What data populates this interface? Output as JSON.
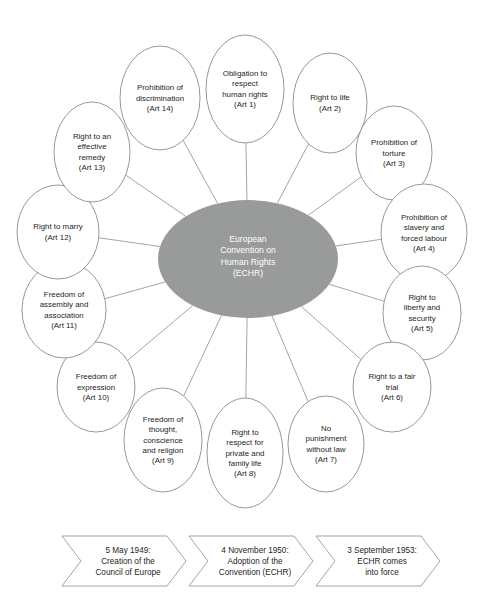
{
  "hub": {
    "lines": [
      "European",
      "Convention on",
      "Human Rights",
      "(ECHR)"
    ],
    "fill_color": "#999a9a",
    "text_color": "#ffffff"
  },
  "nodes": [
    {
      "id": "art-1",
      "lines": [
        "Obligation to",
        "respect",
        "human rights",
        "(Art 1)"
      ],
      "cx": 245,
      "cy": 89,
      "rx": 39,
      "ry": 54
    },
    {
      "id": "art-2",
      "lines": [
        "Right to life",
        "(Art 2)"
      ],
      "cx": 330,
      "cy": 103,
      "rx": 37,
      "ry": 50
    },
    {
      "id": "art-3",
      "lines": [
        "Prohibition of",
        "torture",
        "(Art 3)"
      ],
      "cx": 394,
      "cy": 153,
      "rx": 38,
      "ry": 47
    },
    {
      "id": "art-4",
      "lines": [
        "Prohibition of",
        "slavery and",
        "forced labour",
        "(Art 4)"
      ],
      "cx": 424,
      "cy": 233,
      "rx": 43,
      "ry": 49
    },
    {
      "id": "art-5",
      "lines": [
        "Right to",
        "liberty and",
        "security",
        "(Art 5)"
      ],
      "cx": 422,
      "cy": 313,
      "rx": 39,
      "ry": 47
    },
    {
      "id": "art-6",
      "lines": [
        "Right to a fair",
        "trial",
        "(Art 6)"
      ],
      "cx": 392,
      "cy": 387,
      "rx": 39,
      "ry": 45
    },
    {
      "id": "art-7",
      "lines": [
        "No",
        "punishment",
        "without law",
        "(Art 7)"
      ],
      "cx": 326,
      "cy": 444,
      "rx": 38,
      "ry": 48
    },
    {
      "id": "art-8",
      "lines": [
        "Right to",
        "respect for",
        "private and",
        "family life",
        "(Art 8)"
      ],
      "cx": 245,
      "cy": 453,
      "rx": 38,
      "ry": 55
    },
    {
      "id": "art-9",
      "lines": [
        "Freedom of",
        "thought,",
        "conscience",
        "and religion",
        "(Art 9)"
      ],
      "cx": 163,
      "cy": 440,
      "rx": 39,
      "ry": 52
    },
    {
      "id": "art-10",
      "lines": [
        "Freedom of",
        "expression",
        "(Art 10)"
      ],
      "cx": 96,
      "cy": 387,
      "rx": 39,
      "ry": 45
    },
    {
      "id": "art-11",
      "lines": [
        "Freedom of",
        "assembly and",
        "association",
        "(Art 11)"
      ],
      "cx": 64,
      "cy": 310,
      "rx": 42,
      "ry": 48
    },
    {
      "id": "art-12",
      "lines": [
        "Right to marry",
        "(Art 12)"
      ],
      "cx": 58,
      "cy": 232,
      "rx": 41,
      "ry": 47
    },
    {
      "id": "art-13",
      "lines": [
        "Right to an",
        "effective",
        "remedy",
        "(Art 13)"
      ],
      "cx": 92,
      "cy": 152,
      "rx": 38,
      "ry": 50
    },
    {
      "id": "art-14",
      "lines": [
        "Prohibition of",
        "discrimination",
        "(Art 14)"
      ],
      "cx": 160,
      "cy": 98,
      "rx": 40,
      "ry": 52
    }
  ],
  "timeline": [
    {
      "id": "timeline-1",
      "lines": [
        "5 May 1949:",
        "Creation of the",
        "Council of Europe"
      ]
    },
    {
      "id": "timeline-2",
      "lines": [
        "4 November 1950:",
        "Adoption of the",
        "Convention (ECHR)"
      ]
    },
    {
      "id": "timeline-3",
      "lines": [
        "3 September 1953:",
        "ECHR comes",
        "into force"
      ]
    }
  ]
}
